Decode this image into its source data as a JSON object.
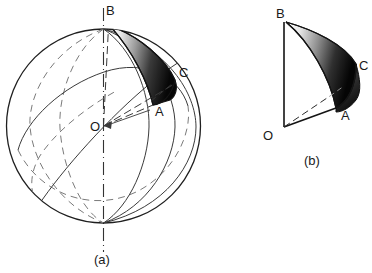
{
  "figure": {
    "background_color": "#ffffff",
    "ink_color": "#1a1a1a",
    "line_color": "#333333",
    "dash_color": "#6a6a6a",
    "shade_dark": "#0d0d0d",
    "shade_light": "#f2f2f2",
    "panels": [
      {
        "id": "panel-a",
        "caption": "(a)",
        "caption_x": 100,
        "caption_y": 259,
        "description": "sphere with meridians, polar axis, and shaded spherical triangle",
        "sphere": {
          "cx": 103.5,
          "cy": 126,
          "r": 97
        },
        "axis": {
          "x": 103.5,
          "y1": 8,
          "y2": 252
        },
        "labels": [
          {
            "text": "B",
            "x": 106,
            "y": 15
          },
          {
            "text": "C",
            "x": 179,
            "y": 77
          },
          {
            "text": "A",
            "x": 155,
            "y": 116
          },
          {
            "text": "O",
            "x": 90,
            "y": 131
          }
        ]
      },
      {
        "id": "panel-b",
        "caption": "(b)",
        "caption_x": 310,
        "caption_y": 163,
        "description": "detached spherical wedge OABC showing the same triangle",
        "labels": [
          {
            "text": "B",
            "x": 281,
            "y": 18
          },
          {
            "text": "C",
            "x": 358,
            "y": 70
          },
          {
            "text": "A",
            "x": 343,
            "y": 117
          },
          {
            "text": "O",
            "x": 265,
            "y": 139
          }
        ],
        "vertices": {
          "O": {
            "x": 284,
            "y": 127
          },
          "B": {
            "x": 284,
            "y": 22
          },
          "A": {
            "x": 336,
            "y": 108
          },
          "C": {
            "x": 354,
            "y": 62
          }
        }
      }
    ]
  }
}
